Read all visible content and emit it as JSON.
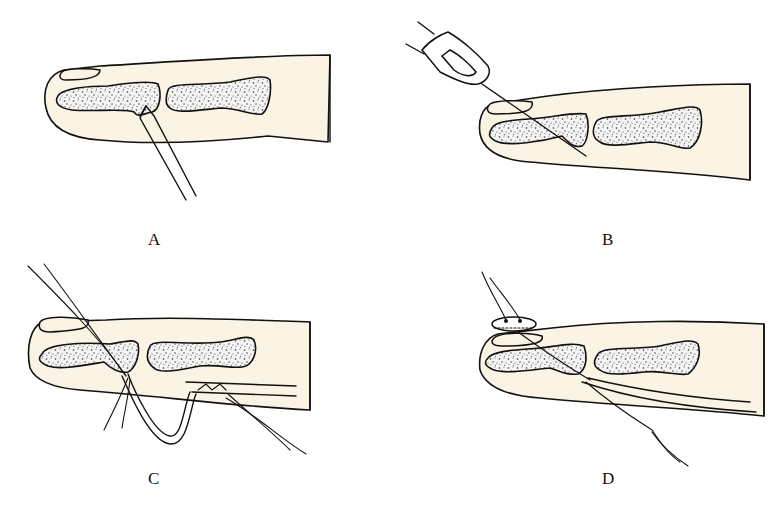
{
  "figure": {
    "panels": [
      {
        "id": "A",
        "label": "A",
        "description": "Distal finger with bone fragment; instrument inserted from below at distal phalanx base"
      },
      {
        "id": "B",
        "label": "B",
        "description": "Kirschner wire / needle driven obliquely through distal phalanx from dorsal tip"
      },
      {
        "id": "C",
        "label": "C",
        "description": "Pull-out suture passed through distal phalanx, looped around tendon stump"
      },
      {
        "id": "D",
        "label": "D",
        "description": "Pull-out suture tied over button on nail; tendon reattached to distal phalanx"
      }
    ]
  },
  "colors": {
    "skin": "#fbf3e3",
    "outline": "#111111",
    "bone_stipple": "#d9d9d9",
    "background": "#ffffff"
  }
}
